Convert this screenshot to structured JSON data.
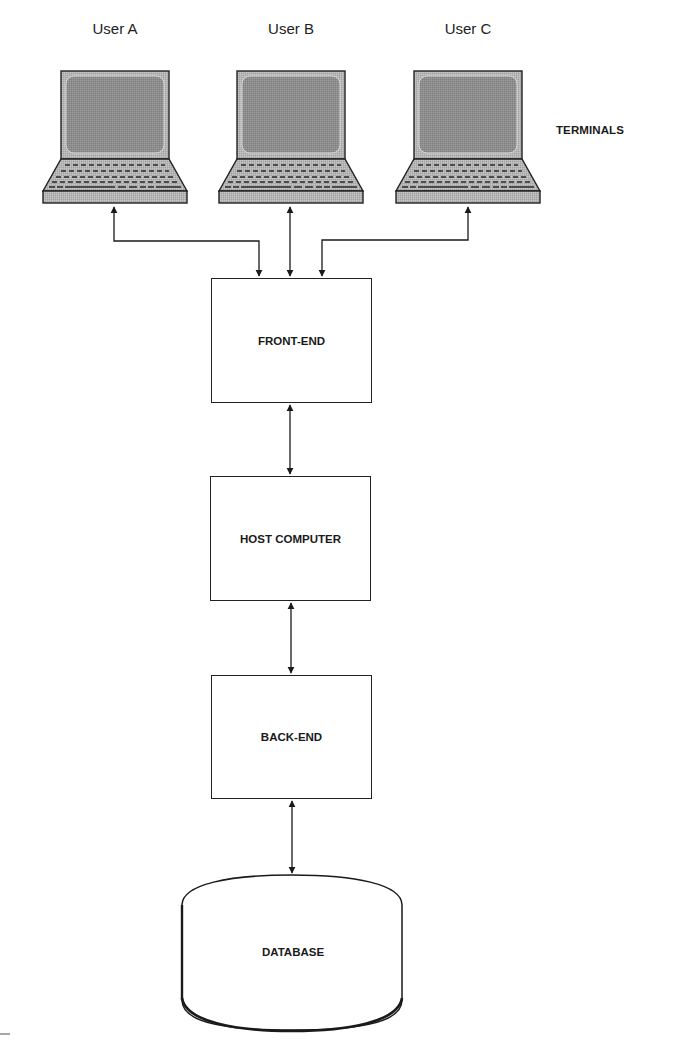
{
  "diagram": {
    "terminals": {
      "group_label": "TERMINALS",
      "users": [
        {
          "label": "User A"
        },
        {
          "label": "User B"
        },
        {
          "label": "User C"
        }
      ]
    },
    "nodes": [
      {
        "id": "front-end",
        "label": "FRONT-END"
      },
      {
        "id": "host-computer",
        "label": "HOST COMPUTER"
      },
      {
        "id": "back-end",
        "label": "BACK-END"
      },
      {
        "id": "database",
        "label": "DATABASE"
      }
    ],
    "edges": [
      {
        "from": "User A",
        "to": "FRONT-END",
        "bidirectional": true
      },
      {
        "from": "User B",
        "to": "FRONT-END",
        "bidirectional": true
      },
      {
        "from": "User C",
        "to": "FRONT-END",
        "bidirectional": true
      },
      {
        "from": "FRONT-END",
        "to": "HOST COMPUTER",
        "bidirectional": true
      },
      {
        "from": "HOST COMPUTER",
        "to": "BACK-END",
        "bidirectional": true
      },
      {
        "from": "BACK-END",
        "to": "DATABASE",
        "bidirectional": true
      }
    ],
    "colors": {
      "line": "#222222",
      "screen": "#8c8c8c",
      "laptop_body": "#b8b8b8",
      "background": "#ffffff"
    }
  }
}
